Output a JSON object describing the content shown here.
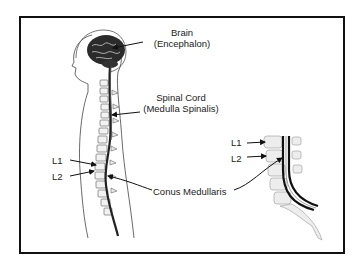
{
  "diagram": {
    "type": "anatomical-illustration",
    "colors": {
      "frame": "#111111",
      "background": "#ffffff",
      "ink": "#222222",
      "bone": "#bbbbbb"
    },
    "labels": {
      "brain_title": "Brain",
      "brain_sub": "(Encephalon)",
      "cord_title": "Spinal Cord",
      "cord_sub": "(Medulla Spinalis)",
      "conus": "Conus Medullaris",
      "l1_left": "L1",
      "l2_left": "L2",
      "l1_right": "L1",
      "l2_right": "L2"
    },
    "figures": [
      {
        "name": "full-body-sagittal",
        "description": "Human outline with brain and full spinal column"
      },
      {
        "name": "lumbar-detail",
        "description": "Close-up of lower spine showing conus medullaris at L1-L2"
      }
    ]
  }
}
